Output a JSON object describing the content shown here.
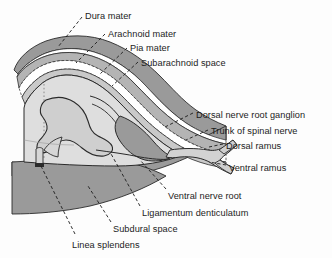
{
  "figure": {
    "background_color": "#fdfdfd",
    "colors": {
      "dura_mater": "#9a9a9a",
      "arachnoid_mater": "#b4b4b4",
      "pia_mater": "#c9c9c9",
      "subarachnoid_space": "#ffffff",
      "spinal_cord_white_matter": "#dedede",
      "spinal_cord_gray_matter": "#cfcfcf",
      "subdural_space": "#ffffff",
      "nerve_trunk": "#d2d2d2",
      "outline": "#2a2a2a",
      "leader_line": "#1c1c1c",
      "text": "#1c1c1c"
    },
    "labels": [
      {
        "id": "dura-mater",
        "text": "Dura mater",
        "x": 85,
        "y": 11
      },
      {
        "id": "arachnoid-mater",
        "text": "Arachnoid mater",
        "x": 108,
        "y": 29
      },
      {
        "id": "pia-mater",
        "text": "Pia mater",
        "x": 130,
        "y": 43
      },
      {
        "id": "subarachnoid-space",
        "text": "Subarachnoid space",
        "x": 141,
        "y": 58
      },
      {
        "id": "dorsal-nerve-root-ganglion",
        "text": "Dorsal nerve root ganglion",
        "x": 196,
        "y": 110
      },
      {
        "id": "trunk-of-spinal-nerve",
        "text": "Trunk of spinal nerve",
        "x": 211,
        "y": 126
      },
      {
        "id": "dorsal-ramus",
        "text": "Dorsal ramus",
        "x": 226,
        "y": 141
      },
      {
        "id": "ventral-ramus",
        "text": "Ventral ramus",
        "x": 229,
        "y": 163
      },
      {
        "id": "ventral-nerve-root",
        "text": "Ventral nerve root",
        "x": 168,
        "y": 191
      },
      {
        "id": "ligamentum-denticulatum",
        "text": "Ligamentum denticulatum",
        "x": 142,
        "y": 208
      },
      {
        "id": "subdural-space",
        "text": "Subdural space",
        "x": 113,
        "y": 224
      },
      {
        "id": "linea-splendens",
        "text": "Linea splendens",
        "x": 72,
        "y": 240
      }
    ]
  }
}
